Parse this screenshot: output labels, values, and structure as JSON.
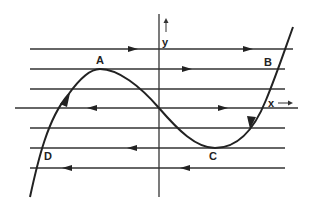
{
  "figure": {
    "type": "phase-line diagram of cubic curve",
    "axes": {
      "x_label": "x",
      "y_label": "y",
      "x_arrow": "→",
      "y_arrow": "↑"
    },
    "points": {
      "A": "A",
      "B": "B",
      "C": "C",
      "D": "D"
    },
    "horizontal_lines": [
      {
        "id": "line-1",
        "direction": "right",
        "arrows": 2
      },
      {
        "id": "line-2",
        "direction": "right",
        "arrows": 1
      },
      {
        "id": "line-3",
        "direction": "none",
        "arrows": 0
      },
      {
        "id": "line-4-x-axis",
        "direction": "left-of-origin: left, right-of-origin: right",
        "arrows": 2
      },
      {
        "id": "line-5",
        "direction": "none",
        "arrows": 0
      },
      {
        "id": "line-6",
        "direction": "left",
        "arrows": 1
      },
      {
        "id": "line-7",
        "direction": "left",
        "arrows": 2
      }
    ],
    "curve": {
      "shape": "cubic, local max at A, local min at C",
      "flow": "upward on left branch through D toward A; downward on right branch from B toward C"
    },
    "colors": {
      "ink": "#222222",
      "background": "#ffffff"
    }
  }
}
